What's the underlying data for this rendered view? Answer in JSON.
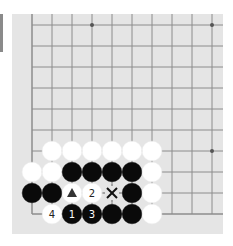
{
  "board": {
    "background": "#e5e5e5",
    "line_color": "#8c8c8c",
    "columns_x": [
      32,
      52,
      72,
      92,
      112,
      132,
      152,
      172,
      192,
      212
    ],
    "rows_y": [
      25,
      46,
      67,
      88,
      109,
      130,
      151,
      172,
      193,
      214
    ],
    "left_edge": true,
    "bottom_edge": true,
    "star_points": [
      [
        3,
        0
      ],
      [
        9,
        0
      ],
      [
        9,
        6
      ]
    ]
  },
  "stones": [
    {
      "color": "white",
      "col": 1,
      "row": 6
    },
    {
      "color": "white",
      "col": 2,
      "row": 6
    },
    {
      "color": "white",
      "col": 3,
      "row": 6
    },
    {
      "color": "white",
      "col": 4,
      "row": 6
    },
    {
      "color": "white",
      "col": 5,
      "row": 6
    },
    {
      "color": "white",
      "col": 6,
      "row": 6
    },
    {
      "color": "white",
      "col": 0,
      "row": 7
    },
    {
      "color": "white",
      "col": 1,
      "row": 7
    },
    {
      "color": "black",
      "col": 2,
      "row": 7
    },
    {
      "color": "black",
      "col": 3,
      "row": 7
    },
    {
      "color": "black",
      "col": 4,
      "row": 7
    },
    {
      "color": "black",
      "col": 5,
      "row": 7
    },
    {
      "color": "white",
      "col": 6,
      "row": 7
    },
    {
      "color": "black",
      "col": 0,
      "row": 8
    },
    {
      "color": "black",
      "col": 1,
      "row": 8
    },
    {
      "color": "white",
      "col": 2,
      "row": 8,
      "mark": "triangle"
    },
    {
      "color": "white",
      "col": 3,
      "row": 8,
      "label": "2"
    },
    {
      "color": "black",
      "col": 5,
      "row": 8
    },
    {
      "color": "white",
      "col": 6,
      "row": 8
    },
    {
      "color": "white",
      "col": 1,
      "row": 9,
      "label": "4"
    },
    {
      "color": "black",
      "col": 2,
      "row": 9,
      "label": "1"
    },
    {
      "color": "black",
      "col": 3,
      "row": 9,
      "label": "3"
    },
    {
      "color": "black",
      "col": 4,
      "row": 9
    },
    {
      "color": "black",
      "col": 5,
      "row": 9
    },
    {
      "color": "white",
      "col": 6,
      "row": 9
    }
  ],
  "markers": [
    {
      "type": "cross",
      "col": 4,
      "row": 8,
      "label": "X"
    }
  ]
}
